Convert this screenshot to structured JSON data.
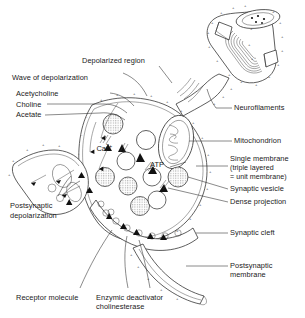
{
  "figure": {
    "background_color": "#ffffff",
    "line_color": "#2a2a2a",
    "text_color": "#1a1a1a"
  },
  "labels": {
    "depolarized_region": "Depolarized region",
    "wave_of_depolarization": "Wave of depolarization",
    "acetycholine": "Acetycholine",
    "choline": "Choline",
    "acetate": "Acetate",
    "calcium_ion": "Ca",
    "calcium_ion_charge": "2+",
    "atp": "ATP",
    "neurofilaments": "Neurofilaments",
    "mitochondrion": "Mitochondrion",
    "single_membrane_line1": "Single membrane",
    "single_membrane_line2": "(triple layered",
    "single_membrane_line3": "= unit membrane)",
    "synaptic_vesicle": "Synaptic vesicle",
    "dense_projection": "Dense projection",
    "synaptic_cleft": "Synaptic cleft",
    "postsynaptic_membrane_line1": "Postsynaptic",
    "postsynaptic_membrane_line2": "membrane",
    "postsynaptic_depolarization_line1": "Postsynaptic",
    "postsynaptic_depolarization_line2": "depolarization",
    "receptor_molecule": "Receptor molecule",
    "enzymic_deactivator_line1": "Enzymic deactivator",
    "enzymic_deactivator_line2": "cholinesterase"
  },
  "membrane_charges": {
    "positive": "+",
    "negative": "-"
  }
}
